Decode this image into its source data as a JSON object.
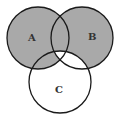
{
  "diagram": {
    "type": "venn",
    "sets": [
      {
        "label": "A",
        "cx": 38,
        "cy": 38,
        "r": 31
      },
      {
        "label": "B",
        "cx": 82,
        "cy": 38,
        "r": 31
      },
      {
        "label": "C",
        "cx": 60,
        "cy": 82,
        "r": 31
      }
    ],
    "shaded_regions": [
      "A only",
      "B only",
      "A∩B only",
      "A∩C only"
    ],
    "unshaded_regions": [
      "A∩B∩C",
      "B∩C only",
      "C only"
    ],
    "colors": {
      "shade": "#a9a9a9",
      "stroke": "#1a1a1a",
      "background": "#ffffff"
    }
  }
}
